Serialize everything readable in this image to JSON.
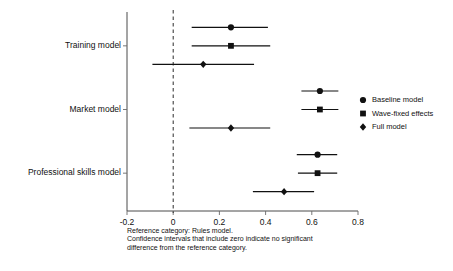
{
  "chart_data": {
    "type": "scatter",
    "subtype": "forest-plot",
    "title": "",
    "xlabel": "",
    "ylabel": "",
    "xlim": [
      -0.2,
      0.8
    ],
    "xticks": [
      -0.2,
      0,
      0.2,
      0.4,
      0.6,
      0.8
    ],
    "xticklabels": [
      "-0.2",
      "0",
      "0.2",
      "0.4",
      "0.6",
      "0.8"
    ],
    "grid": false,
    "reference_line": 0,
    "reference_line_style": "dashed",
    "legend_position": "right",
    "categories": [
      "Training model",
      "Market model",
      "Professional skills model"
    ],
    "series": [
      {
        "name": "Baseline model",
        "marker": "circle",
        "values": [
          0.25,
          0.635,
          0.625
        ],
        "ci_low": [
          0.08,
          0.555,
          0.535
        ],
        "ci_high": [
          0.41,
          0.715,
          0.71
        ]
      },
      {
        "name": "Wave-fixed effects",
        "marker": "square",
        "values": [
          0.25,
          0.635,
          0.625
        ],
        "ci_low": [
          0.08,
          0.555,
          0.54
        ],
        "ci_high": [
          0.42,
          0.715,
          0.71
        ]
      },
      {
        "name": "Full model",
        "marker": "diamond",
        "values": [
          0.13,
          0.25,
          0.48
        ],
        "ci_low": [
          -0.09,
          0.07,
          0.345
        ],
        "ci_high": [
          0.35,
          0.42,
          0.61
        ]
      }
    ]
  },
  "legend": {
    "entries": [
      {
        "label": "Baseline model",
        "marker": "circle"
      },
      {
        "label": "Wave-fixed effects",
        "marker": "square"
      },
      {
        "label": "Full model",
        "marker": "diamond"
      }
    ]
  },
  "footnote": {
    "line1": "Reference category: Rules model.",
    "line2": "Confidence intervals that include zero indicate no significant",
    "line3": "difference from the reference category."
  },
  "colors": {
    "marker": "#111111",
    "axis": "#4a4a4a",
    "zero_line": "#2a2a2a",
    "background": "#ffffff"
  }
}
